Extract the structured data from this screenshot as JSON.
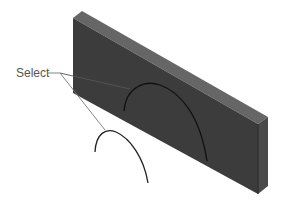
{
  "diagram": {
    "callout": {
      "label": "Select",
      "count": 2
    },
    "part": {
      "type": "thin rectangular plate (isometric view)"
    },
    "colors": {
      "front_face": "#3c3c3c",
      "top_face": "#666666",
      "side_face": "#4a4a4a",
      "edge_curve": "#111111",
      "leader": "#777777",
      "label": "#555555"
    },
    "elements": [
      {
        "name": "sketch-arc-on-face",
        "description": "semi-elliptical arc drawn on plate front face"
      },
      {
        "name": "sketch-arc-free",
        "description": "open arc curve below the plate"
      }
    ]
  }
}
